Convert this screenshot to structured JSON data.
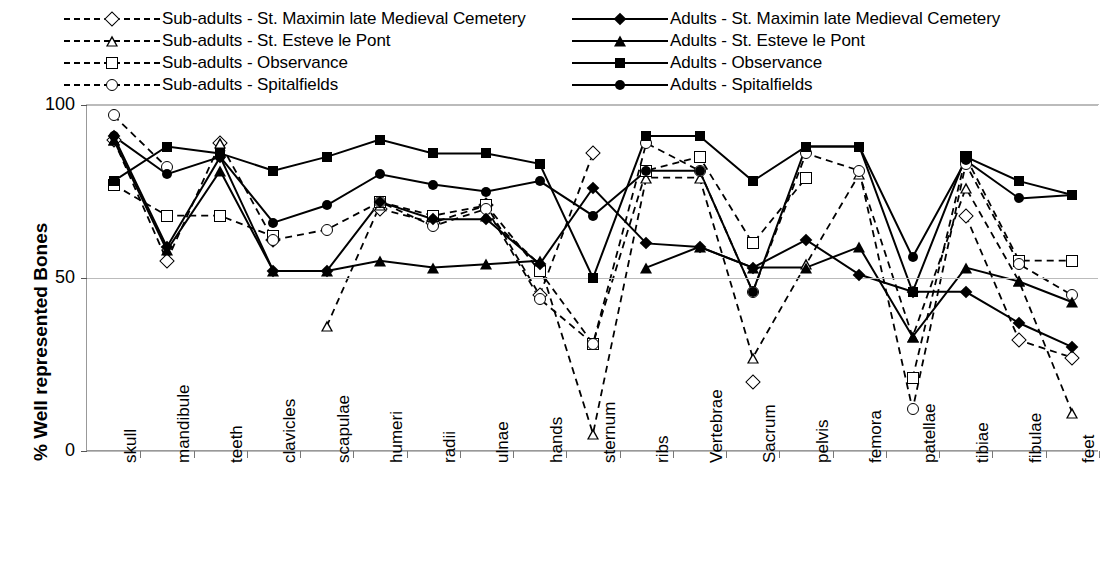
{
  "legend": {
    "left_column": [
      {
        "label": "Sub-adults - St. Maximin late Medieval Cemetery",
        "marker": "diamond-open",
        "line": "dashed"
      },
      {
        "label": "Sub-adults - St. Esteve le Pont",
        "marker": "triangle-open",
        "line": "dashed"
      },
      {
        "label": "Sub-adults - Observance",
        "marker": "square-open",
        "line": "dashed"
      },
      {
        "label": "Sub-adults - Spitalfields",
        "marker": "circle-open",
        "line": "dashed"
      }
    ],
    "right_column": [
      {
        "label": "Adults - St. Maximin late Medieval Cemetery",
        "marker": "diamond-filled",
        "line": "solid"
      },
      {
        "label": "Adults - St. Esteve le Pont",
        "marker": "triangle-filled",
        "line": "solid"
      },
      {
        "label": "Adults - Observance",
        "marker": "square-filled",
        "line": "solid"
      },
      {
        "label": "Adults - Spitalfields",
        "marker": "circle-filled",
        "line": "solid"
      }
    ]
  },
  "axis": {
    "ylabel": "% Well represented Bones",
    "yticks": [
      "0",
      "50",
      "100"
    ]
  },
  "chart_data": {
    "type": "line",
    "title": "",
    "xlabel": "",
    "ylabel": "% Well represented Bones",
    "ylim": [
      0,
      100
    ],
    "yticks": [
      0,
      50,
      100
    ],
    "grid": true,
    "legend_position": "top",
    "categories": [
      "skull",
      "mandibule",
      "teeth",
      "clavicles",
      "scapulae",
      "humeri",
      "radii",
      "ulnae",
      "hands",
      "sternum",
      "ribs",
      "Vertebrae",
      "Sacrum",
      "pelvis",
      "femora",
      "patellae",
      "tibiae",
      "fibulae",
      "feet"
    ],
    "series": [
      {
        "name": "Sub-adults - St. Maximin late Medieval Cemetery",
        "marker": "diamond-open",
        "line": "dashed",
        "values": [
          90,
          55,
          89,
          61,
          null,
          70,
          66,
          71,
          45,
          86,
          null,
          null,
          20,
          null,
          null,
          null,
          68,
          32,
          27
        ]
      },
      {
        "name": "Sub-adults - St. Esteve le Pont",
        "marker": "triangle-open",
        "line": "dashed",
        "values": [
          90,
          null,
          89,
          null,
          36,
          71,
          null,
          68,
          54,
          5,
          79,
          79,
          27,
          54,
          80,
          33,
          76,
          49,
          11
        ]
      },
      {
        "name": "Sub-adults - Observance",
        "marker": "square-open",
        "line": "dashed",
        "values": [
          77,
          68,
          68,
          62,
          null,
          72,
          68,
          71,
          52,
          31,
          81,
          85,
          60,
          79,
          null,
          21,
          85,
          55,
          55
        ]
      },
      {
        "name": "Sub-adults - Spitalfields",
        "marker": "circle-open",
        "line": "dashed",
        "values": [
          97,
          82,
          null,
          61,
          64,
          72,
          65,
          70,
          44,
          31,
          89,
          81,
          46,
          86,
          81,
          12,
          83,
          54,
          45
        ]
      },
      {
        "name": "Adults - St. Maximin late Medieval Cemetery",
        "marker": "diamond-filled",
        "line": "solid",
        "values": [
          91,
          59,
          85,
          52,
          52,
          72,
          67,
          67,
          54,
          76,
          60,
          59,
          53,
          61,
          51,
          46,
          46,
          37,
          30
        ]
      },
      {
        "name": "Adults - St. Esteve le Pont",
        "marker": "triangle-filled",
        "line": "solid",
        "values": [
          90,
          58,
          81,
          52,
          52,
          55,
          53,
          54,
          55,
          null,
          53,
          59,
          53,
          53,
          59,
          33,
          53,
          49,
          43
        ]
      },
      {
        "name": "Adults - Observance",
        "marker": "square-filled",
        "line": "solid",
        "values": [
          78,
          88,
          86,
          81,
          85,
          90,
          86,
          86,
          83,
          50,
          91,
          91,
          78,
          88,
          88,
          46,
          85,
          78,
          74
        ]
      },
      {
        "name": "Adults - Spitalfields",
        "marker": "circle-filled",
        "line": "solid",
        "values": [
          91,
          80,
          85,
          66,
          71,
          80,
          77,
          75,
          78,
          68,
          81,
          81,
          46,
          88,
          88,
          56,
          84,
          73,
          74
        ]
      }
    ]
  }
}
